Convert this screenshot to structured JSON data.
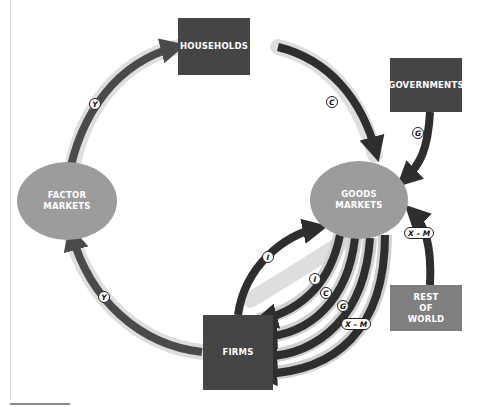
{
  "nodes": {
    "households": "HOUSEHOLDS",
    "governments": "GOVERNMENTS",
    "factor_markets": "FACTOR\nMARKETS",
    "goods_markets": "GOODS\nMARKETS",
    "firms": "FIRMS",
    "rest_of_world": "REST\nOF\nWORLD"
  },
  "flows": {
    "factor_to_households": "Y",
    "firms_to_factor": "Y",
    "households_to_goods": "C",
    "governments_to_goods": "G",
    "row_to_goods": "X – M",
    "firms_to_goods": "I",
    "goods_to_firms_i": "I",
    "goods_to_firms_c": "C",
    "goods_to_firms_g": "G",
    "goods_to_firms_xm": "X – M"
  },
  "colors": {
    "dark_box": "#454545",
    "mid_box": "#7f7f7f",
    "ellipse": "#9c9c9c",
    "arrow": "#2e2e2e",
    "halo": "#dcdcdc"
  }
}
